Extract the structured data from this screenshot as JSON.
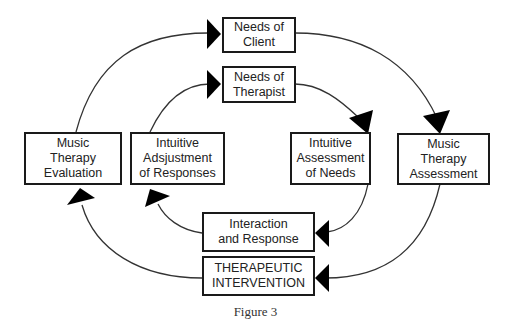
{
  "diagram": {
    "nodes": {
      "needs_client": "Needs of\nClient",
      "needs_therapist": "Needs of\nTherapist",
      "mt_evaluation": "Music\nTherapy\nEvaluation",
      "intuitive_adjustment": "Intuitive\nAdsjustment\nof Responses",
      "intuitive_assessment": "Intuitive\nAssessment\nof Needs",
      "mt_assessment": "Music\nTherapy\nAssessment",
      "interaction_response": "Interaction\nand Response",
      "therapeutic_intervention": "THERAPEUTIC\nINTERVENTION"
    },
    "edges": [
      {
        "from": "Music Therapy Evaluation",
        "to": "Needs of Client"
      },
      {
        "from": "Needs of Client",
        "to": "Music Therapy Assessment"
      },
      {
        "from": "Music Therapy Assessment",
        "to": "THERAPEUTIC INTERVENTION"
      },
      {
        "from": "THERAPEUTIC INTERVENTION",
        "to": "Music Therapy Evaluation"
      },
      {
        "from": "Intuitive Adsjustment of Responses",
        "to": "Needs of Therapist"
      },
      {
        "from": "Needs of Therapist",
        "to": "Intuitive Assessment of Needs"
      },
      {
        "from": "Intuitive Assessment of Needs",
        "to": "Interaction and Response"
      },
      {
        "from": "Interaction and Response",
        "to": "Intuitive Adsjustment of Responses"
      }
    ],
    "caption": "Figure 3"
  }
}
